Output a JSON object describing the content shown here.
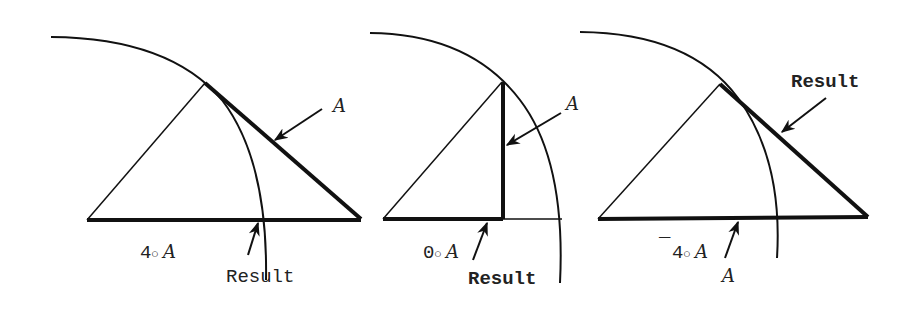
{
  "figure": {
    "panels": [
      {
        "id": "panel-1",
        "expression": {
          "prefix": "",
          "left": "4",
          "op": "○",
          "right": "A"
        },
        "labels": {
          "upper_arrow": "A",
          "lower_arrow": "Result"
        }
      },
      {
        "id": "panel-2",
        "expression": {
          "prefix": "",
          "left": "0",
          "op": "○",
          "right": "A"
        },
        "labels": {
          "upper_arrow": "A",
          "lower_arrow": "Result"
        }
      },
      {
        "id": "panel-3",
        "expression": {
          "prefix": "¯",
          "left": "4",
          "op": "○",
          "right": "A"
        },
        "labels": {
          "upper_arrow": "Result",
          "lower_arrow": "A"
        }
      }
    ],
    "colors": {
      "ink": "#111111",
      "background": "#ffffff"
    }
  }
}
